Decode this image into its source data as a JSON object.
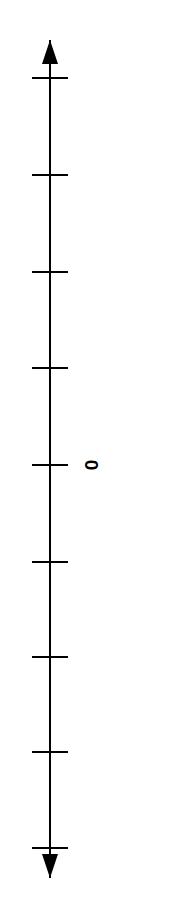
{
  "figure": {
    "width": 170,
    "height": 919,
    "background_color": "#ffffff",
    "stroke_color": "#000000",
    "axis_line_width": 2,
    "tick_line_width": 2
  },
  "axis": {
    "name": "vertical-number-line",
    "orientation": "vertical",
    "x_position": 50,
    "top_arrow_tip_y": 40,
    "bottom_arrow_tip_y": 878,
    "arrowhead_width": 16,
    "arrowhead_length": 24,
    "double_headed": true
  },
  "ticks": {
    "count": 9,
    "half_length": 18,
    "positions_y": [
      78,
      175,
      272,
      368,
      465,
      562,
      657,
      752,
      848
    ],
    "spacing_px": 96.3,
    "labeled_index": 4
  },
  "labels": [
    {
      "text": "0",
      "name": "tick-label-zero",
      "tick_index": 4,
      "x": 91,
      "y": 465,
      "rotation_deg": 90,
      "font_size_px": 19,
      "color": "#000000"
    }
  ],
  "chart_data": {
    "type": "line",
    "title": "",
    "subtitle": "",
    "xlabel": "",
    "ylabel": "",
    "orientation": "vertical",
    "grid": false,
    "legend": null,
    "series": [],
    "axis_ticks": {
      "labels": [
        "",
        "",
        "",
        "",
        "0",
        "",
        "",
        "",
        ""
      ],
      "pixel_y": [
        78,
        175,
        272,
        368,
        465,
        562,
        657,
        752,
        848
      ]
    },
    "annotations": [
      {
        "text": "0",
        "at_tick_index": 4,
        "rotation_deg": 90
      }
    ]
  }
}
